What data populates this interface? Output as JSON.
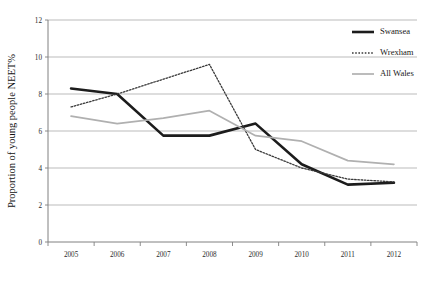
{
  "chart_data": {
    "type": "line",
    "title": "",
    "xlabel": "",
    "ylabel": "Proportion of young people NEET%",
    "categories": [
      "2005",
      "2006",
      "2007",
      "2008",
      "2009",
      "2010",
      "2011",
      "2012"
    ],
    "x": [
      2005,
      2006,
      2007,
      2008,
      2009,
      2010,
      2011,
      2012
    ],
    "ylim": [
      0,
      12
    ],
    "yticks": [
      0,
      2,
      4,
      6,
      8,
      10,
      12
    ],
    "ytick_labels": [
      "0",
      "2",
      "4",
      "6",
      "8",
      "10",
      "12"
    ],
    "grid": "horizontal",
    "legend_position": "top-right",
    "series": [
      {
        "name": "Swansea",
        "values": [
          8.3,
          8.0,
          5.75,
          5.75,
          6.4,
          4.2,
          3.1,
          3.2
        ],
        "color": "#1c1c1c",
        "style": "solid",
        "width": 2.6
      },
      {
        "name": "Wrexham",
        "values": [
          7.3,
          8.0,
          8.8,
          9.6,
          5.0,
          4.0,
          3.4,
          3.25
        ],
        "color": "#3a3a3a",
        "style": "dotted",
        "width": 1.3
      },
      {
        "name": "All Wales",
        "values": [
          6.8,
          6.4,
          6.7,
          7.1,
          5.75,
          5.45,
          4.4,
          4.2
        ],
        "color": "#b0b0b0",
        "style": "solid",
        "width": 1.7
      }
    ]
  },
  "legend": {
    "items": [
      {
        "label": "Swansea"
      },
      {
        "label": "Wrexham"
      },
      {
        "label": "All Wales"
      }
    ]
  }
}
